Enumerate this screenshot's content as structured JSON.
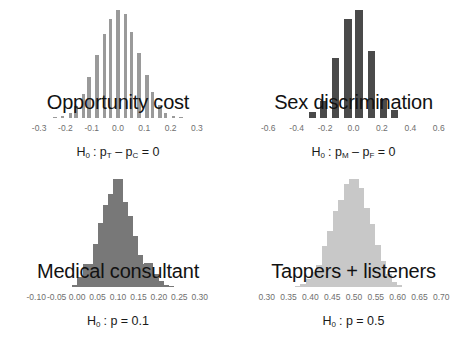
{
  "figure": {
    "type": "multi-panel-histogram",
    "panel_count": 4,
    "background": "#ffffff"
  },
  "chart_data": [
    {
      "type": "bar",
      "title": "Opportunity cost",
      "xlabel": "H0: pT - pC = 0",
      "ylabel": "",
      "color": "#9a9a9a",
      "bar_style": "thin-spaced",
      "xlim": [
        -0.35,
        0.35
      ],
      "ticks": [
        -0.3,
        -0.2,
        -0.1,
        0.0,
        0.1,
        0.2,
        0.3
      ],
      "tick_labels": [
        "-0.3",
        "-0.2",
        "-0.1",
        "0.0",
        "0.1",
        "0.2",
        "0.3"
      ],
      "x": [
        -0.24,
        -0.21,
        -0.18,
        -0.16,
        -0.13,
        -0.11,
        -0.08,
        -0.05,
        -0.03,
        0.0,
        0.03,
        0.05,
        0.08,
        0.11,
        0.13,
        0.16,
        0.18,
        0.21,
        0.24
      ],
      "values": [
        1,
        2,
        5,
        11,
        22,
        38,
        58,
        78,
        92,
        100,
        96,
        80,
        60,
        40,
        24,
        12,
        5,
        2,
        1
      ],
      "grid": false,
      "legend": "none"
    },
    {
      "type": "bar",
      "title": "Sex discrimination",
      "xlabel": "H0: pM - pF = 0",
      "ylabel": "",
      "color": "#4a4a4a",
      "bar_style": "thick-spaced",
      "xlim": [
        -0.7,
        0.7
      ],
      "ticks": [
        -0.6,
        -0.4,
        -0.2,
        0.0,
        0.2,
        0.4,
        0.6
      ],
      "tick_labels": [
        "-0.6",
        "-0.4",
        "-0.2",
        "0.0",
        "0.2",
        "0.4",
        "0.6"
      ],
      "x": [
        -0.29,
        -0.21,
        -0.125,
        -0.04,
        0.04,
        0.125,
        0.21,
        0.29
      ],
      "values": [
        6,
        16,
        56,
        92,
        100,
        62,
        18,
        7
      ],
      "grid": false,
      "legend": "none"
    },
    {
      "type": "bar",
      "title": "Medical consultant",
      "xlabel": "H0: p = 0.1",
      "ylabel": "",
      "color": "#787878",
      "bar_style": "wide-contiguous",
      "xlim": [
        -0.125,
        0.325
      ],
      "ticks": [
        -0.1,
        -0.05,
        0.0,
        0.05,
        0.1,
        0.15,
        0.2,
        0.25,
        0.3
      ],
      "tick_labels": [
        "-0.10",
        "-0.05",
        "0.00",
        "0.05",
        "0.10",
        "0.15",
        "0.20",
        "0.25",
        "0.30"
      ],
      "x": [
        0.0,
        0.0125,
        0.025,
        0.0375,
        0.05,
        0.0625,
        0.075,
        0.0875,
        0.1,
        0.1125,
        0.125,
        0.1375,
        0.15,
        0.1625,
        0.175,
        0.1875,
        0.2,
        0.2125,
        0.225
      ],
      "values": [
        2,
        9,
        21,
        21,
        40,
        59,
        76,
        86,
        100,
        79,
        66,
        47,
        30,
        21,
        22,
        12,
        6,
        2,
        1
      ],
      "grid": false,
      "legend": "none"
    },
    {
      "type": "bar",
      "title": "Tappers + listeners",
      "xlabel": "H0: p = 0.5",
      "ylabel": "",
      "color": "#c8c8c8",
      "bar_style": "wide-contiguous",
      "xlim": [
        0.28,
        0.72
      ],
      "ticks": [
        0.3,
        0.35,
        0.4,
        0.45,
        0.5,
        0.55,
        0.6,
        0.65,
        0.7
      ],
      "tick_labels": [
        "0.30",
        "0.35",
        "0.40",
        "0.45",
        "0.50",
        "0.55",
        "0.60",
        "0.65",
        "0.70"
      ],
      "x": [
        0.375,
        0.3875,
        0.4,
        0.4125,
        0.425,
        0.4375,
        0.45,
        0.4625,
        0.475,
        0.4875,
        0.5,
        0.5125,
        0.525,
        0.5375,
        0.55,
        0.5625,
        0.575,
        0.5875,
        0.6
      ],
      "values": [
        1,
        3,
        7,
        14,
        20,
        38,
        52,
        70,
        81,
        95,
        100,
        92,
        73,
        58,
        39,
        24,
        12,
        5,
        2
      ],
      "grid": false,
      "legend": "none"
    }
  ]
}
